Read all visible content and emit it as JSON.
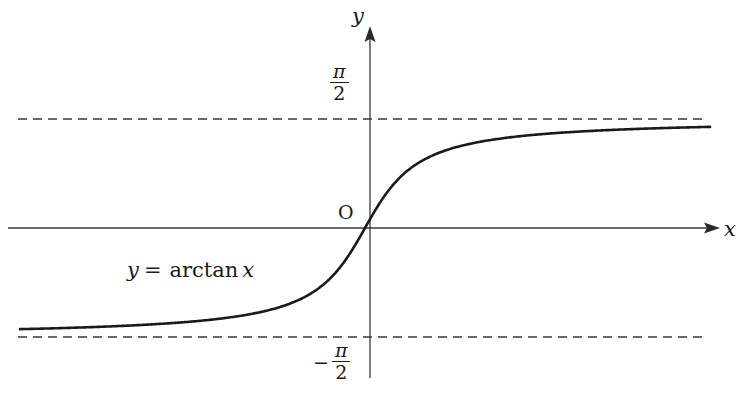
{
  "figure": {
    "title": "",
    "background_color": "#ffffff",
    "width": 742,
    "height": 396
  },
  "axes": {
    "x_axis_label": "x",
    "y_axis_label": "y",
    "origin_label": "O",
    "axis_color": "#3a3a3a"
  },
  "labels": {
    "curve_equation": {
      "lhs": "y",
      "equals": "=",
      "function": "arctan",
      "argument": "x",
      "full_text": "y = arctan x"
    },
    "upper_asymptote": {
      "numerator": "π",
      "denominator": "2",
      "sign": "",
      "full_text": "π/2"
    },
    "lower_asymptote": {
      "numerator": "π",
      "denominator": "2",
      "sign": "−",
      "full_text": "−π/2"
    }
  },
  "chart_data": {
    "type": "line",
    "title": "",
    "xlabel": "x",
    "ylabel": "y",
    "function": "y = arctan(x)",
    "grid": false,
    "legend": null,
    "annotations": [
      {
        "text": "y = arctan x",
        "x": -5.8,
        "y": -0.55
      },
      {
        "text": "O",
        "x": -0.45,
        "y": 0.2
      },
      {
        "text": "π/2",
        "x": -0.45,
        "y": 1.77
      },
      {
        "text": "−π/2",
        "x": -0.7,
        "y": -1.77
      }
    ],
    "asymptotes": [
      {
        "type": "horizontal",
        "value": 1.5708,
        "label": "π/2",
        "style": "dashed"
      },
      {
        "type": "horizontal",
        "value": -1.5708,
        "label": "−π/2",
        "style": "dashed"
      }
    ],
    "xlim": [
      -9.0,
      9.6
    ],
    "ylim": [
      -2.2,
      2.6
    ],
    "x": [
      -8.8,
      -8.0,
      -7.2,
      -6.4,
      -5.6,
      -4.8,
      -4.0,
      -3.2,
      -2.4,
      -1.6,
      -1.2,
      -0.8,
      -0.4,
      0.0,
      0.4,
      0.8,
      1.2,
      1.6,
      2.4,
      3.2,
      4.0,
      4.8,
      5.6,
      6.4,
      7.2,
      8.0,
      8.8
    ],
    "values": [
      -1.458,
      -1.446,
      -1.433,
      -1.416,
      -1.394,
      -1.365,
      -1.326,
      -1.268,
      -1.176,
      -1.012,
      -0.876,
      -0.675,
      -0.381,
      0.0,
      0.381,
      0.675,
      0.876,
      1.012,
      1.176,
      1.268,
      1.326,
      1.365,
      1.394,
      1.416,
      1.433,
      1.446,
      1.458
    ],
    "series": [
      {
        "name": "arctan(x)",
        "color": "#1a1a1a",
        "line_width": 2.6,
        "style": "solid"
      }
    ],
    "key_points": [
      {
        "label": "origin",
        "x": 0,
        "y": 0
      }
    ]
  }
}
